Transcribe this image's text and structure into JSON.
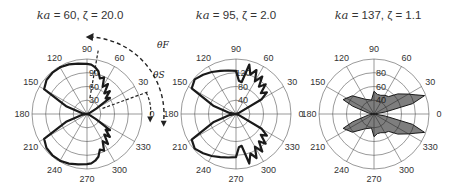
{
  "chart_data": [
    {
      "type": "polar",
      "title": "ka = 60, ζ = 20.0",
      "title_parts": {
        "ka_label": "ka",
        "ka_value": "60",
        "zeta_label": "ζ",
        "zeta_value": "20.0"
      },
      "center_px": [
        87,
        114
      ],
      "radius_px": 55,
      "angular_ticks": [
        0,
        30,
        60,
        90,
        120,
        150,
        180,
        210,
        240,
        270,
        300,
        330
      ],
      "radial_ticks": [
        30,
        60,
        90
      ],
      "radial_max": 90,
      "pattern_description": "Two broad lobes toward ~75-150° and ~210-285° with ripples on right side near 30-75° and 285-330°",
      "series": [
        {
          "name": "scattering pattern",
          "angles_deg": [
            0,
            20,
            30,
            35,
            40,
            45,
            50,
            55,
            60,
            65,
            70,
            75,
            80,
            85,
            90,
            100,
            110,
            120,
            130,
            140,
            150,
            160,
            170,
            180
          ],
          "values": [
            0,
            4,
            20,
            52,
            45,
            60,
            50,
            68,
            58,
            75,
            70,
            82,
            88,
            92,
            93,
            95,
            98,
            100,
            100,
            98,
            92,
            40,
            10,
            0
          ]
        }
      ],
      "annotations": [
        {
          "label": "θF",
          "type": "dashed-arc-arrow",
          "from_deg": 20,
          "to_deg": 90
        },
        {
          "label": "θS",
          "type": "dashed-arrow",
          "direction": "down"
        }
      ]
    },
    {
      "type": "polar",
      "title": "ka = 95, ζ = 2.0",
      "title_parts": {
        "ka_label": "ka",
        "ka_value": "95",
        "zeta_label": "ζ",
        "zeta_value": "2.0"
      },
      "center_px": [
        236,
        114
      ],
      "radius_px": 55,
      "angular_ticks": [
        0,
        30,
        60,
        90,
        120,
        150,
        180,
        210,
        240,
        270,
        300,
        330
      ],
      "radial_ticks": [
        40,
        80,
        120
      ],
      "radial_max": 120,
      "pattern_description": "Lobes toward ~80-150° and ~210-280°, ripples near 30-80° and 280-330°",
      "series": [
        {
          "name": "scattering pattern",
          "angles_deg": [
            0,
            20,
            30,
            35,
            40,
            45,
            50,
            55,
            60,
            65,
            70,
            75,
            80,
            85,
            90,
            100,
            110,
            120,
            130,
            140,
            150,
            160,
            170,
            180
          ],
          "values": [
            0,
            5,
            55,
            70,
            60,
            78,
            66,
            85,
            70,
            90,
            78,
            95,
            60,
            62,
            80,
            82,
            85,
            90,
            95,
            100,
            95,
            45,
            12,
            0
          ]
        }
      ]
    },
    {
      "type": "polar",
      "title": "ka = 137, ζ = 1.1",
      "title_parts": {
        "ka_label": "ka",
        "ka_value": "137",
        "zeta_label": "ζ",
        "zeta_value": "1.1"
      },
      "center_px": [
        374,
        114
      ],
      "radius_px": 55,
      "angular_ticks": [
        0,
        30,
        60,
        90,
        120,
        150,
        180,
        210,
        240,
        270,
        300,
        330
      ],
      "radial_ticks": [
        40,
        60,
        80
      ],
      "radial_max": 80,
      "pattern_description": "Dense fine-structured lobes concentrated between 10-90° and 270-350°, thin lobes reaching ~160°/200°",
      "series": [
        {
          "name": "scattering pattern",
          "angles_deg": [
            0,
            10,
            15,
            20,
            25,
            30,
            40,
            50,
            60,
            70,
            80,
            90,
            100,
            120,
            140,
            155,
            160,
            170,
            180
          ],
          "values": [
            0,
            20,
            70,
            95,
            80,
            70,
            55,
            40,
            38,
            35,
            35,
            40,
            25,
            30,
            50,
            60,
            40,
            10,
            0
          ]
        }
      ]
    }
  ]
}
